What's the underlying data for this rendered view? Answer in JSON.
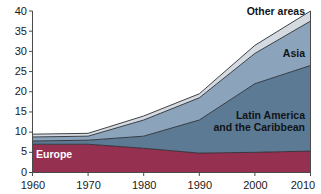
{
  "chart_data": {
    "type": "area",
    "stacked": true,
    "title": "",
    "subtitle": "",
    "xlabel": "",
    "ylabel": "",
    "x": [
      1960,
      1970,
      1980,
      1990,
      2000,
      2010
    ],
    "xtick_labels": [
      "1960",
      "1970",
      "1980",
      "1990",
      "2000",
      "2010"
    ],
    "ytick_labels": [
      "0",
      "5",
      "10",
      "15",
      "20",
      "25",
      "30",
      "35",
      "40"
    ],
    "yticks": [
      0,
      5,
      10,
      15,
      20,
      25,
      30,
      35,
      40
    ],
    "ylim": [
      0,
      40
    ],
    "xlim": [
      1960,
      2010
    ],
    "grid": false,
    "legend": "inline-labels",
    "series": [
      {
        "name": "Europe",
        "label": "Europe",
        "color": "#963050",
        "label_color": "#ffffff",
        "values": [
          7.0,
          7.0,
          6.0,
          4.8,
          5.0,
          5.3
        ]
      },
      {
        "name": "Latin America and the Caribbean",
        "label": "Latin America\nand the Caribbean",
        "label_line1": "Latin America",
        "label_line2": "and the Caribbean",
        "color": "#5c7a94",
        "label_color": "#111418",
        "values": [
          0.8,
          1.0,
          3.0,
          8.2,
          17.0,
          21.2
        ]
      },
      {
        "name": "Asia",
        "label": "Asia",
        "color": "#8ba4bb",
        "label_color": "#111418",
        "values": [
          1.0,
          1.0,
          4.0,
          5.5,
          7.5,
          11.0
        ]
      },
      {
        "name": "Other areas",
        "label": "Other areas",
        "color": "#d5dae0",
        "label_color": "#111418",
        "values": [
          0.7,
          0.7,
          1.0,
          1.0,
          2.0,
          2.5
        ]
      }
    ],
    "cumulative_totals": [
      9.5,
      9.7,
      14.0,
      19.5,
      31.5,
      40.0
    ]
  },
  "labels": {
    "europe": "Europe",
    "latin_america_line1": "Latin America",
    "latin_america_line2": "and the Caribbean",
    "asia": "Asia",
    "other_areas": "Other areas"
  },
  "yticks": {
    "t0": "0",
    "t5": "5",
    "t10": "10",
    "t15": "15",
    "t20": "20",
    "t25": "25",
    "t30": "30",
    "t35": "35",
    "t40": "40"
  },
  "xticks": {
    "x1960": "1960",
    "x1970": "1970",
    "x1980": "1980",
    "x1990": "1990",
    "x2000": "2000",
    "x2010": "2010"
  },
  "colors": {
    "europe": "#963050",
    "latin_america": "#5c7a94",
    "asia": "#8ba4bb",
    "other_areas": "#d5dae0",
    "axis": "#4a4a4a",
    "outline": "#2a2f36",
    "background": "#ffffff"
  }
}
